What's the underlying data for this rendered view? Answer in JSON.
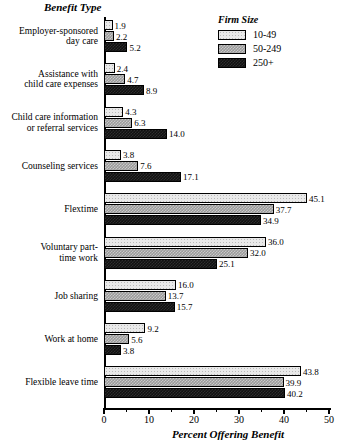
{
  "chart_data": {
    "type": "bar",
    "orientation": "horizontal",
    "title": "",
    "xlabel": "Percent Offering Benefit",
    "ylabel": "Benefit Type",
    "xlim": [
      0,
      50
    ],
    "xticks": [
      0,
      10,
      20,
      30,
      40,
      50
    ],
    "xtick_labels": [
      "0",
      "10",
      "20",
      "30",
      "40",
      "50"
    ],
    "grid": false,
    "legend_title": "Firm Size",
    "legend_position": "top-right",
    "categories": [
      "Employer-sponsored\nday care",
      "Assistance with\nchild care expenses",
      "Child care information\nor referral services",
      "Counseling services",
      "Flextime",
      "Voluntary part-\ntime work",
      "Job sharing",
      "Work at home",
      "Flexible leave time"
    ],
    "series": [
      {
        "name": "10-49",
        "values": [
          1.9,
          2.4,
          4.3,
          3.8,
          45.1,
          36.0,
          16.0,
          9.2,
          43.8
        ],
        "labels": [
          "1.9",
          "2.4",
          "4.3",
          "3.8",
          "45.1",
          "36.0",
          "16.0",
          "9.2",
          "43.8"
        ],
        "fill": "light-dotted"
      },
      {
        "name": "50-249",
        "values": [
          2.2,
          4.7,
          6.3,
          7.6,
          37.7,
          32.0,
          13.7,
          5.6,
          39.9
        ],
        "labels": [
          "2.2",
          "4.7",
          "6.3",
          "7.6",
          "37.7",
          "32.0",
          "13.7",
          "5.6",
          "39.9"
        ],
        "fill": "gray-checker"
      },
      {
        "name": "250+",
        "values": [
          5.2,
          8.9,
          14.0,
          17.1,
          34.9,
          25.1,
          15.7,
          3.8,
          40.2
        ],
        "labels": [
          "5.2",
          "8.9",
          "14.0",
          "17.1",
          "34.9",
          "25.1",
          "15.7",
          "3.8",
          "40.2"
        ],
        "fill": "black"
      }
    ]
  }
}
